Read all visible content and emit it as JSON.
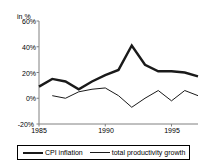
{
  "chart_data": {
    "type": "line",
    "title": "",
    "subtitle": "",
    "unit_label": "in %",
    "xlabel": "",
    "ylabel": "",
    "x": [
      1985,
      1986,
      1987,
      1988,
      1989,
      1990,
      1991,
      1992,
      1993,
      1994,
      1995,
      1996,
      1997
    ],
    "xlim": [
      1985,
      1997
    ],
    "ylim": [
      -20,
      60
    ],
    "yticks": [
      -20,
      0,
      20,
      40,
      60
    ],
    "ytick_labels": [
      "-20%",
      "0%",
      "20%",
      "40%",
      "60%"
    ],
    "xticks": [
      1985,
      1990,
      1995
    ],
    "xtick_labels": [
      "1985",
      "1990",
      "1995"
    ],
    "grid": false,
    "legend_position": "bottom",
    "series": [
      {
        "name": "CPI inflation",
        "style": "thick",
        "color": "#1a1a1a",
        "x": [
          1985,
          1986,
          1987,
          1988,
          1989,
          1990,
          1991,
          1992,
          1993,
          1994,
          1995,
          1996,
          1997
        ],
        "values": [
          9,
          15,
          13,
          7,
          13,
          18,
          22,
          41,
          26,
          21,
          21,
          20,
          17
        ]
      },
      {
        "name": "total productivity growth",
        "style": "thin",
        "color": "#1a1a1a",
        "x": [
          1986,
          1987,
          1988,
          1989,
          1990,
          1991,
          1992,
          1993,
          1994,
          1995,
          1996,
          1997
        ],
        "values": [
          2,
          0,
          5,
          7,
          8,
          2,
          -7,
          0,
          6,
          -2,
          6,
          2
        ]
      }
    ]
  },
  "legend": {
    "items": [
      {
        "label": "CPI inflation"
      },
      {
        "label": "total productivity growth"
      }
    ]
  }
}
